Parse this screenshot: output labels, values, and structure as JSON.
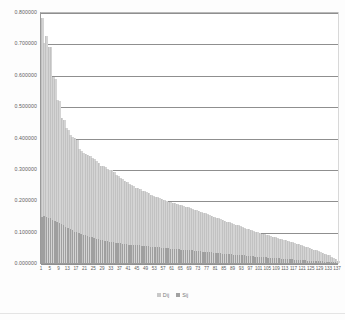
{
  "title": {
    "text": ""
  },
  "legend": {
    "items": [
      {
        "label": "Dij",
        "marker": "square-marker",
        "color": "#c9c9c9"
      },
      {
        "label": "Sij",
        "marker": "square-marker",
        "color": "#a2a2a2"
      }
    ]
  },
  "axes": {
    "y_tick_labels": [
      "0.800000",
      "0.700000",
      "0.600000",
      "0.500000",
      "0.400000",
      "0.300000",
      "0.200000",
      "0.100000",
      "0.000000"
    ],
    "x_tick_labels": [
      "1",
      "5",
      "9",
      "13",
      "17",
      "21",
      "25",
      "29",
      "33",
      "37",
      "41",
      "45",
      "49",
      "53",
      "57",
      "61",
      "65",
      "69",
      "73",
      "77",
      "81",
      "85",
      "89",
      "93",
      "97",
      "101",
      "105",
      "109",
      "113",
      "117",
      "121",
      "125",
      "129",
      "133",
      "137"
    ]
  },
  "chart_data": {
    "type": "bar",
    "title": "",
    "xlabel": "",
    "ylabel": "",
    "ylim": [
      0.0,
      0.8
    ],
    "xlim": [
      1,
      137
    ],
    "grid": true,
    "legend_position": "bottom",
    "ytick_values": [
      0.8,
      0.7,
      0.6,
      0.5,
      0.4,
      0.3,
      0.2,
      0.1,
      0.0
    ],
    "ytick_format": "0.000000",
    "xtick_values": [
      1,
      5,
      9,
      13,
      17,
      21,
      25,
      29,
      33,
      37,
      41,
      45,
      49,
      53,
      57,
      61,
      65,
      69,
      73,
      77,
      81,
      85,
      89,
      93,
      97,
      101,
      105,
      109,
      113,
      117,
      121,
      125,
      129,
      133,
      137
    ],
    "xtick_step": 4,
    "categories": [
      1,
      2,
      3,
      4,
      5,
      6,
      7,
      8,
      9,
      10,
      11,
      12,
      13,
      14,
      15,
      16,
      17,
      18,
      19,
      20,
      21,
      22,
      23,
      24,
      25,
      26,
      27,
      28,
      29,
      30,
      31,
      32,
      33,
      34,
      35,
      36,
      37,
      38,
      39,
      40,
      41,
      42,
      43,
      44,
      45,
      46,
      47,
      48,
      49,
      50,
      51,
      52,
      53,
      54,
      55,
      56,
      57,
      58,
      59,
      60,
      61,
      62,
      63,
      64,
      65,
      66,
      67,
      68,
      69,
      70,
      71,
      72,
      73,
      74,
      75,
      76,
      77,
      78,
      79,
      80,
      81,
      82,
      83,
      84,
      85,
      86,
      87,
      88,
      89,
      90,
      91,
      92,
      93,
      94,
      95,
      96,
      97,
      98,
      99,
      100,
      101,
      102,
      103,
      104,
      105,
      106,
      107,
      108,
      109,
      110,
      111,
      112,
      113,
      114,
      115,
      116,
      117,
      118,
      119,
      120,
      121,
      122,
      123,
      124,
      125,
      126,
      127,
      128,
      129,
      130,
      131,
      132,
      133,
      134,
      135,
      136,
      137
    ],
    "series": [
      {
        "name": "Dij",
        "color": "#d4d4d4",
        "values": [
          0.78,
          0.7,
          0.722,
          0.69,
          0.688,
          0.592,
          0.588,
          0.52,
          0.515,
          0.462,
          0.455,
          0.43,
          0.425,
          0.408,
          0.402,
          0.4,
          0.392,
          0.362,
          0.358,
          0.352,
          0.348,
          0.345,
          0.34,
          0.336,
          0.33,
          0.325,
          0.32,
          0.31,
          0.308,
          0.305,
          0.3,
          0.298,
          0.295,
          0.29,
          0.282,
          0.278,
          0.272,
          0.268,
          0.262,
          0.258,
          0.252,
          0.248,
          0.245,
          0.24,
          0.238,
          0.235,
          0.23,
          0.228,
          0.225,
          0.222,
          0.218,
          0.215,
          0.212,
          0.21,
          0.208,
          0.205,
          0.2,
          0.198,
          0.196,
          0.194,
          0.192,
          0.19,
          0.188,
          0.186,
          0.184,
          0.182,
          0.18,
          0.178,
          0.175,
          0.172,
          0.17,
          0.168,
          0.165,
          0.162,
          0.16,
          0.158,
          0.155,
          0.152,
          0.15,
          0.148,
          0.145,
          0.142,
          0.14,
          0.138,
          0.135,
          0.132,
          0.13,
          0.128,
          0.125,
          0.122,
          0.12,
          0.118,
          0.115,
          0.112,
          0.11,
          0.108,
          0.105,
          0.103,
          0.1,
          0.098,
          0.096,
          0.094,
          0.092,
          0.09,
          0.088,
          0.086,
          0.084,
          0.082,
          0.08,
          0.078,
          0.076,
          0.074,
          0.072,
          0.07,
          0.068,
          0.066,
          0.064,
          0.062,
          0.06,
          0.058,
          0.055,
          0.052,
          0.05,
          0.048,
          0.045,
          0.042,
          0.04,
          0.038,
          0.035,
          0.032,
          0.03,
          0.027,
          0.024,
          0.02,
          0.016,
          0.012,
          0.008
        ]
      },
      {
        "name": "Sij",
        "color": "#9f9f9f",
        "values": [
          0.148,
          0.15,
          0.146,
          0.144,
          0.142,
          0.138,
          0.135,
          0.132,
          0.128,
          0.124,
          0.12,
          0.116,
          0.112,
          0.108,
          0.104,
          0.1,
          0.098,
          0.095,
          0.092,
          0.09,
          0.088,
          0.086,
          0.084,
          0.082,
          0.08,
          0.078,
          0.076,
          0.074,
          0.072,
          0.07,
          0.069,
          0.068,
          0.067,
          0.066,
          0.065,
          0.064,
          0.063,
          0.062,
          0.061,
          0.06,
          0.059,
          0.058,
          0.058,
          0.057,
          0.056,
          0.056,
          0.055,
          0.054,
          0.054,
          0.053,
          0.052,
          0.052,
          0.051,
          0.05,
          0.05,
          0.049,
          0.048,
          0.048,
          0.047,
          0.046,
          0.046,
          0.045,
          0.044,
          0.044,
          0.043,
          0.042,
          0.042,
          0.041,
          0.04,
          0.04,
          0.039,
          0.038,
          0.038,
          0.037,
          0.036,
          0.036,
          0.035,
          0.034,
          0.034,
          0.033,
          0.032,
          0.032,
          0.031,
          0.03,
          0.03,
          0.029,
          0.028,
          0.028,
          0.027,
          0.026,
          0.026,
          0.025,
          0.024,
          0.024,
          0.023,
          0.022,
          0.022,
          0.021,
          0.02,
          0.02,
          0.019,
          0.019,
          0.018,
          0.018,
          0.017,
          0.017,
          0.016,
          0.016,
          0.015,
          0.015,
          0.014,
          0.014,
          0.013,
          0.013,
          0.012,
          0.012,
          0.011,
          0.011,
          0.01,
          0.01,
          0.009,
          0.009,
          0.008,
          0.008,
          0.007,
          0.007,
          0.006,
          0.006,
          0.005,
          0.005,
          0.004,
          0.004,
          0.003,
          0.003,
          0.002,
          0.002,
          0.001
        ]
      }
    ]
  }
}
